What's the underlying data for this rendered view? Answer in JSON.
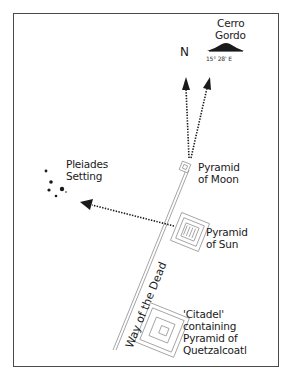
{
  "diagram": {
    "north_label": "N",
    "mountain": {
      "name_line1": "Cerro",
      "name_line2": "Gordo",
      "bearing": "15° 28' E"
    },
    "pleiades": {
      "line1": "Pleiades",
      "line2": "Setting"
    },
    "pyramid_moon": {
      "line1": "Pyramid",
      "line2": "of Moon"
    },
    "pyramid_sun": {
      "line1": "Pyramid",
      "line2": "of Sun"
    },
    "citadel": {
      "line1": "'Citadel'",
      "line2": "containing",
      "line3": "Pyramid of",
      "line4": "Quetzalcoatl"
    },
    "road_label": "Way of the Dead",
    "colors": {
      "ink": "#1a1a1a",
      "frame": "#4a4a4a",
      "structure": "#9a9a9a"
    }
  }
}
